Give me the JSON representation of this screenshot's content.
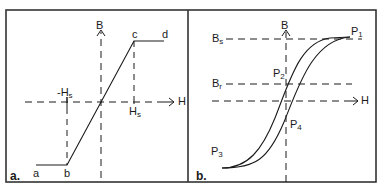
{
  "figure": {
    "panel_a": {
      "tag": "a.",
      "axis_b": "B",
      "axis_h": "H",
      "points": [
        "a",
        "b",
        "c",
        "d"
      ],
      "neg_saturation_label": "-H",
      "neg_saturation_sub": "s",
      "pos_saturation_label": "H",
      "pos_saturation_sub": "s"
    },
    "panel_b": {
      "tag": "b.",
      "axis_b": "B",
      "axis_h": "H",
      "saturation_label": "B",
      "saturation_sub": "s",
      "remanence_label": "B",
      "remanence_sub": "r",
      "p1": "P",
      "p1_sub": "1",
      "p2": "P",
      "p2_sub": "2",
      "p3": "P",
      "p3_sub": "3",
      "p4": "P",
      "p4_sub": "4"
    }
  },
  "colors": {
    "line": "#1a1a1a",
    "frame": "#333333",
    "background": "#ffffff"
  }
}
